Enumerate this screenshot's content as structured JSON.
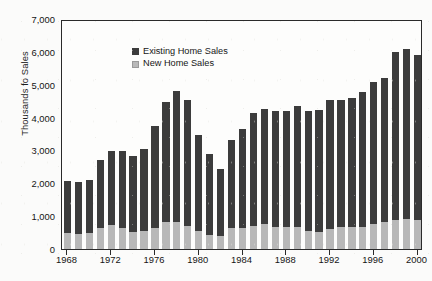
{
  "chart_data": {
    "type": "bar",
    "subtype": "stacked-bar",
    "title": "",
    "xlabel": "",
    "ylabel": "Thousands fo Sales",
    "ylim": [
      0,
      7000
    ],
    "ytick_values": [
      0,
      1000,
      2000,
      3000,
      4000,
      5000,
      6000,
      7000
    ],
    "ytick_labels": [
      "0",
      "1,000",
      "2,000",
      "3,000",
      "4,000",
      "5,000",
      "6,000",
      "7,000"
    ],
    "xtick_labels": [
      "1968",
      "1972",
      "1976",
      "1980",
      "1984",
      "1988",
      "1992",
      "1996",
      "2000"
    ],
    "grid": false,
    "legend_position": "top-left",
    "categories": [
      "1968",
      "1969",
      "1970",
      "1971",
      "1972",
      "1973",
      "1974",
      "1975",
      "1976",
      "1977",
      "1978",
      "1979",
      "1980",
      "1981",
      "1982",
      "1983",
      "1984",
      "1985",
      "1986",
      "1987",
      "1988",
      "1989",
      "1990",
      "1991",
      "1992",
      "1993",
      "1994",
      "1995",
      "1996",
      "1997",
      "1998",
      "1999",
      "2000"
    ],
    "series": [
      {
        "name": "New Home Sales",
        "color": "#b8b8b8",
        "values": [
          490,
          450,
          485,
          650,
          720,
          635,
          520,
          550,
          645,
          810,
          815,
          710,
          545,
          435,
          410,
          625,
          640,
          690,
          760,
          680,
          680,
          660,
          540,
          515,
          615,
          680,
          680,
          670,
          760,
          810,
          890,
          900,
          880
        ]
      },
      {
        "name": "Existing Home Sales",
        "color": "#3c3c3c",
        "values": [
          1570,
          1600,
          1615,
          2050,
          2270,
          2355,
          2300,
          2480,
          3090,
          3650,
          3990,
          3820,
          2925,
          2450,
          2020,
          2700,
          3000,
          3450,
          3490,
          3530,
          3510,
          3690,
          3670,
          3705,
          3910,
          3845,
          3910,
          4100,
          4330,
          4380,
          5095,
          5190,
          5030
        ]
      }
    ],
    "totals": [
      2060,
      2050,
      2100,
      2700,
      2990,
      2990,
      2820,
      3030,
      3735,
      4460,
      4805,
      4530,
      3470,
      2885,
      2430,
      3325,
      3640,
      4140,
      4250,
      4210,
      4190,
      4350,
      4210,
      4220,
      4525,
      4525,
      4590,
      4770,
      5090,
      5190,
      5985,
      6090,
      5910
    ]
  },
  "legend": {
    "items": [
      {
        "label": "Existing Home Sales"
      },
      {
        "label": "New Home Sales"
      }
    ]
  }
}
